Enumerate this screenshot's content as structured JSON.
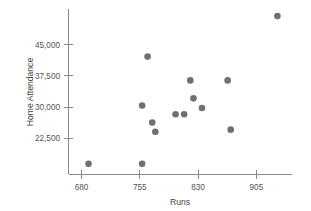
{
  "chart_data": {
    "type": "scatter",
    "title": "",
    "xlabel": "Runs",
    "ylabel": "Home Attendance",
    "xticks": [
      680,
      755,
      830,
      905
    ],
    "xtick_labels": [
      "680",
      "755",
      "830",
      "905"
    ],
    "yticks": [
      22500,
      30000,
      37500,
      45000
    ],
    "ytick_labels": [
      "22,500",
      "30,000",
      "37,500",
      "45,000"
    ],
    "xlim": [
      661,
      932
    ],
    "ylim": [
      14500,
      53000
    ],
    "grid": false,
    "legend": null,
    "marker": {
      "shape": "circle",
      "color": "#707070",
      "size": 4.6
    },
    "points": [
      {
        "x": 689,
        "y": 16400
      },
      {
        "x": 758,
        "y": 16400
      },
      {
        "x": 765,
        "y": 42100
      },
      {
        "x": 758,
        "y": 30400
      },
      {
        "x": 771,
        "y": 26300
      },
      {
        "x": 775,
        "y": 24100
      },
      {
        "x": 801,
        "y": 28300
      },
      {
        "x": 812,
        "y": 28300
      },
      {
        "x": 820,
        "y": 36400
      },
      {
        "x": 824,
        "y": 32100
      },
      {
        "x": 835,
        "y": 29800
      },
      {
        "x": 868,
        "y": 36400
      },
      {
        "x": 872,
        "y": 24600
      },
      {
        "x": 932,
        "y": 51800
      }
    ]
  },
  "axis": {
    "x_title": "Runs",
    "y_title": "Home Attendance"
  }
}
